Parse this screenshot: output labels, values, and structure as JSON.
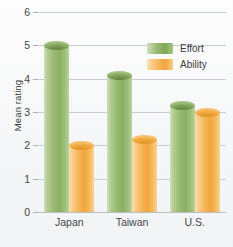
{
  "chart_data": {
    "type": "bar",
    "title": "",
    "xlabel": "",
    "ylabel": "Mean rating",
    "categories": [
      "Japan",
      "Taiwan",
      "U.S."
    ],
    "series": [
      {
        "name": "Effort",
        "color": "#8ab064",
        "values": [
          5.0,
          4.1,
          3.2
        ]
      },
      {
        "name": "Ability",
        "color": "#f2a63c",
        "values": [
          2.0,
          2.2,
          3.0
        ]
      }
    ],
    "ylim": [
      0,
      6
    ],
    "yticks": [
      0,
      1,
      2,
      3,
      4,
      5,
      6
    ],
    "ytick_labels": [
      "0",
      "1",
      "2",
      "3",
      "4",
      "5",
      "6"
    ],
    "grid": true,
    "legend_position": "upper right",
    "bar_style": "cylinder-3d"
  }
}
